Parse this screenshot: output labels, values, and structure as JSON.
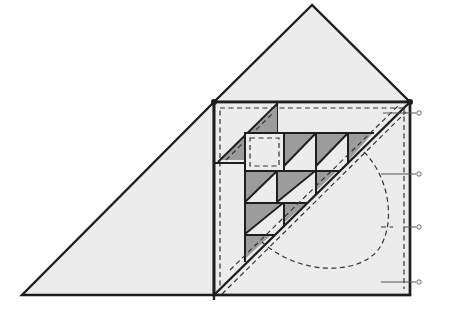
{
  "diagram": {
    "type": "quilt-block-pattern",
    "colors": {
      "background": "#ffffff",
      "light_fabric": "#ececec",
      "dark_fabric": "#9c9c9c",
      "outline": "#1e1e1e",
      "seam_dash": "#333333"
    },
    "top_triangle": {
      "apex": [
        312,
        5
      ],
      "base_left": [
        214,
        102
      ],
      "base_right": [
        410,
        102
      ]
    },
    "left_triangle": {
      "top": [
        214,
        102
      ],
      "bottom_left": [
        22,
        295
      ],
      "bottom_right": [
        214,
        295
      ]
    },
    "square_block": {
      "x": 214,
      "y": 102,
      "w": 196,
      "h": 193
    },
    "inner_grid": {
      "columns": [
        245,
        284,
        316,
        348
      ],
      "rows": [
        133,
        171,
        203,
        235,
        260
      ]
    },
    "right_ticks": [
      113,
      174,
      227,
      282
    ],
    "labels": []
  }
}
